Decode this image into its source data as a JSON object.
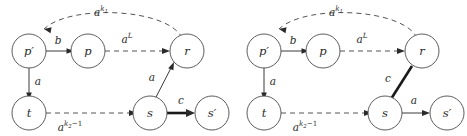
{
  "figure": {
    "title": "",
    "background_color": "#ffffff",
    "stroke_color": "#3a3a3a",
    "dashed_stroke_color": "#555555",
    "thick_stroke_color": "#1a1a1a",
    "panels": [
      {
        "id": "left-panel",
        "name": "left-graph",
        "nodes": [
          {
            "id": "p_prime",
            "label": "p′",
            "label_base": "p",
            "label_prime": "′"
          },
          {
            "id": "p",
            "label": "p",
            "label_base": "p",
            "label_prime": ""
          },
          {
            "id": "r",
            "label": "r",
            "label_base": "r",
            "label_prime": ""
          },
          {
            "id": "t",
            "label": "t",
            "label_base": "t",
            "label_prime": ""
          },
          {
            "id": "s",
            "label": "s",
            "label_base": "s",
            "label_prime": ""
          },
          {
            "id": "s_prime",
            "label": "s′",
            "label_base": "s",
            "label_prime": "′"
          }
        ],
        "edges": [
          {
            "id": "r-to-pprime",
            "from": "r",
            "to": "p_prime",
            "style": "dashed",
            "label_base": "a",
            "label_sup": "k",
            "label_subsup": "1",
            "label_tail": "",
            "label_text": "a^{k_1}"
          },
          {
            "id": "pprime-to-p",
            "from": "p_prime",
            "to": "p",
            "style": "solid",
            "label_base": "b",
            "label_sup": "",
            "label_subsup": "",
            "label_tail": "",
            "label_text": "b"
          },
          {
            "id": "p-to-r",
            "from": "p",
            "to": "r",
            "style": "dashed",
            "label_base": "a",
            "label_sup": "L",
            "label_subsup": "",
            "label_tail": "",
            "label_text": "a^{L}"
          },
          {
            "id": "pprime-to-t",
            "from": "p_prime",
            "to": "t",
            "style": "solid",
            "label_base": "a",
            "label_sup": "",
            "label_subsup": "",
            "label_tail": "",
            "label_text": "a"
          },
          {
            "id": "t-to-s",
            "from": "t",
            "to": "s",
            "style": "dashed",
            "label_base": "a",
            "label_sup": "k",
            "label_subsup": "2",
            "label_tail": "−1",
            "label_text": "a^{k_2-1}"
          },
          {
            "id": "s-to-r",
            "from": "s",
            "to": "r",
            "style": "solid",
            "label_base": "a",
            "label_sup": "",
            "label_subsup": "",
            "label_tail": "",
            "label_text": "a"
          },
          {
            "id": "s-to-sprime",
            "from": "s",
            "to": "s_prime",
            "style": "thick",
            "label_base": "c",
            "label_sup": "",
            "label_subsup": "",
            "label_tail": "",
            "label_text": "c"
          }
        ]
      },
      {
        "id": "right-panel",
        "name": "right-graph",
        "nodes": [
          {
            "id": "p_prime",
            "label": "p′",
            "label_base": "p",
            "label_prime": "′"
          },
          {
            "id": "p",
            "label": "p",
            "label_base": "p",
            "label_prime": ""
          },
          {
            "id": "r",
            "label": "r",
            "label_base": "r",
            "label_prime": ""
          },
          {
            "id": "t",
            "label": "t",
            "label_base": "t",
            "label_prime": ""
          },
          {
            "id": "s",
            "label": "s",
            "label_base": "s",
            "label_prime": ""
          },
          {
            "id": "s_prime",
            "label": "s′",
            "label_base": "s",
            "label_prime": "′"
          }
        ],
        "edges": [
          {
            "id": "r-to-pprime",
            "from": "r",
            "to": "p_prime",
            "style": "dashed",
            "label_base": "a",
            "label_sup": "k",
            "label_subsup": "1",
            "label_tail": "",
            "label_text": "a^{k_1}"
          },
          {
            "id": "pprime-to-p",
            "from": "p_prime",
            "to": "p",
            "style": "solid",
            "label_base": "b",
            "label_sup": "",
            "label_subsup": "",
            "label_tail": "",
            "label_text": "b"
          },
          {
            "id": "p-to-r",
            "from": "p",
            "to": "r",
            "style": "dashed",
            "label_base": "a",
            "label_sup": "L",
            "label_subsup": "",
            "label_tail": "",
            "label_text": "a^{L}"
          },
          {
            "id": "pprime-to-t",
            "from": "p_prime",
            "to": "t",
            "style": "solid",
            "label_base": "a",
            "label_sup": "",
            "label_subsup": "",
            "label_tail": "",
            "label_text": "a"
          },
          {
            "id": "t-to-s",
            "from": "t",
            "to": "s",
            "style": "dashed",
            "label_base": "a",
            "label_sup": "k",
            "label_subsup": "2",
            "label_tail": "−1",
            "label_text": "a^{k_2-1}"
          },
          {
            "id": "s-to-r",
            "from": "s",
            "to": "r",
            "style": "thick",
            "label_base": "c",
            "label_sup": "",
            "label_subsup": "",
            "label_tail": "",
            "label_text": "c"
          },
          {
            "id": "s-to-sprime",
            "from": "s",
            "to": "s_prime",
            "style": "solid",
            "label_base": "a",
            "label_sup": "",
            "label_subsup": "",
            "label_tail": "",
            "label_text": "a"
          }
        ]
      }
    ]
  }
}
